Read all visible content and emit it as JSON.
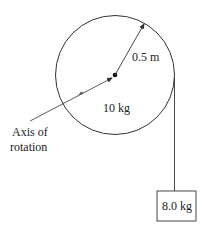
{
  "diagram": {
    "type": "pulley-with-hanging-mass",
    "pulley": {
      "mass_label": "10 kg",
      "radius_label": "0.5 m",
      "center_dot": true
    },
    "axis_label": {
      "line1": "Axis of",
      "line2": "rotation"
    },
    "hanging_block": {
      "mass_label": "8.0 kg"
    },
    "colors": {
      "stroke": "#333333",
      "text": "#222222",
      "background": "#ffffff"
    }
  }
}
